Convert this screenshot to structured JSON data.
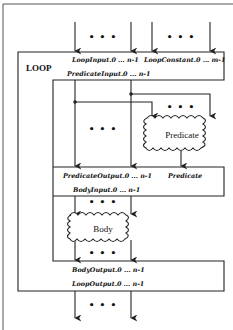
{
  "diagram": {
    "title": "LOOP",
    "loop_inputs_label": "LoopInput.0 ... n-1",
    "loop_constants_label": "LoopConstant.0 ... m-1",
    "predicate_inputs_label": "PredicateInput.0 ... n-1",
    "predicate_node_label": "Predicate",
    "predicate_outputs_label": "PredicateOutput.0 ... n-1",
    "predicate_result_label": "Predicate",
    "body_inputs_label": "BodyInput.0 ... n-1",
    "body_node_label": "Body",
    "body_outputs_label": "BodyOutput.0 ... n-1",
    "loop_outputs_label": "LoopOutput.0 ... n-1",
    "ellipsis": "• • •"
  },
  "colors": {
    "line": "#222222",
    "background": "#ffffff"
  }
}
